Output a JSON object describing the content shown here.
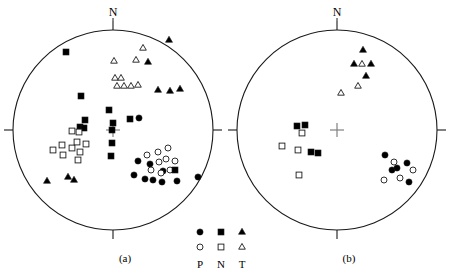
{
  "figure": {
    "type": "stereonet-pair",
    "panels": [
      {
        "id": "a",
        "label": "(a)",
        "north_label": "N"
      },
      {
        "id": "b",
        "label": "(b)",
        "north_label": "N"
      }
    ]
  },
  "legend": {
    "columns": [
      {
        "key": "P",
        "label": "P",
        "filled_symbol": "filled-circle",
        "open_symbol": "open-circle"
      },
      {
        "key": "N",
        "label": "N",
        "filled_symbol": "filled-square",
        "open_symbol": "open-square"
      },
      {
        "key": "T",
        "label": "T",
        "filled_symbol": "filled-triangle",
        "open_symbol": "open-triangle"
      }
    ]
  },
  "colors": {
    "stroke": "#1a1a1a",
    "fill": "#000000",
    "open_fill": "#ffffff",
    "center_cross": "#808080",
    "background": "#ffffff"
  },
  "chart_data": {
    "type": "scatter",
    "title": "",
    "subtitle": "",
    "xlabel": "",
    "ylabel": "",
    "grid": false,
    "legend_position": "bottom-center",
    "projection": "lower-hemisphere stereographic (equal-area) net",
    "axis_note": "Coordinates are plot pixels; circle centre is the net origin, radius = 100",
    "panels": [
      {
        "id": "a",
        "label": "(a)",
        "center": [
          113,
          130
        ],
        "radius": 100,
        "ticks": [
          "N",
          "E",
          "S",
          "W"
        ],
        "series": [
          {
            "name": "P filled",
            "symbol": "filled-circle",
            "points": [
              [
                138,
                161
              ],
              [
                134,
                175
              ],
              [
                145,
                179
              ],
              [
                153,
                180
              ],
              [
                150,
                164
              ],
              [
                163,
                171
              ],
              [
                162,
                182
              ],
              [
                177,
                181
              ],
              [
                198,
                177
              ],
              [
                139,
                118
              ]
            ]
          },
          {
            "name": "P open",
            "symbol": "open-circle",
            "points": [
              [
                147,
                155
              ],
              [
                158,
                152
              ],
              [
                168,
                148
              ],
              [
                159,
                162
              ],
              [
                151,
                170
              ],
              [
                161,
                173
              ],
              [
                170,
                170
              ],
              [
                166,
                159
              ],
              [
                175,
                161
              ]
            ]
          },
          {
            "name": "N filled",
            "symbol": "filled-square",
            "points": [
              [
                66,
                52
              ],
              [
                81,
                96
              ],
              [
                112,
                130
              ],
              [
                109,
                110
              ],
              [
                113,
                123
              ],
              [
                130,
                119
              ],
              [
                85,
                120
              ],
              [
                80,
                127
              ],
              [
                84,
                128
              ],
              [
                111,
                156
              ],
              [
                112,
                143
              ],
              [
                175,
                170
              ]
            ]
          },
          {
            "name": "N open",
            "symbol": "open-square",
            "points": [
              [
                72,
                131
              ],
              [
                79,
                132
              ],
              [
                53,
                150
              ],
              [
                63,
                155
              ],
              [
                62,
                145
              ],
              [
                72,
                148
              ],
              [
                77,
                142
              ],
              [
                80,
                152
              ],
              [
                86,
                144
              ],
              [
                78,
                160
              ]
            ]
          },
          {
            "name": "T filled",
            "symbol": "filled-triangle",
            "points": [
              [
                169,
                40
              ],
              [
                148,
                62
              ],
              [
                180,
                89
              ],
              [
                158,
                90
              ],
              [
                170,
                91
              ],
              [
                47,
                181
              ],
              [
                68,
                177
              ],
              [
                74,
                180
              ]
            ]
          },
          {
            "name": "T open",
            "symbol": "open-triangle",
            "points": [
              [
                143,
                48
              ],
              [
                114,
                61
              ],
              [
                136,
                60
              ],
              [
                115,
                78
              ],
              [
                121,
                78
              ],
              [
                117,
                86
              ],
              [
                124,
                86
              ],
              [
                131,
                86
              ],
              [
                138,
                85
              ]
            ]
          }
        ]
      },
      {
        "id": "b",
        "label": "(b)",
        "center": [
          337,
          130
        ],
        "radius": 100,
        "ticks": [
          "N",
          "E",
          "S",
          "W"
        ],
        "series": [
          {
            "name": "P filled",
            "symbol": "filled-circle",
            "points": [
              [
                385,
                155
              ],
              [
                392,
                170
              ],
              [
                397,
                168
              ],
              [
                407,
                163
              ],
              [
                409,
                182
              ]
            ]
          },
          {
            "name": "P open",
            "symbol": "open-circle",
            "points": [
              [
                394,
                162
              ],
              [
                400,
                178
              ],
              [
                384,
                180
              ],
              [
                413,
                170
              ]
            ]
          },
          {
            "name": "N filled",
            "symbol": "filled-square",
            "points": [
              [
                297,
                126
              ],
              [
                305,
                125
              ],
              [
                311,
                152
              ],
              [
                318,
                153
              ]
            ]
          },
          {
            "name": "N open",
            "symbol": "open-square",
            "points": [
              [
                302,
                133
              ],
              [
                282,
                146
              ],
              [
                298,
                150
              ],
              [
                299,
                175
              ]
            ]
          },
          {
            "name": "T filled",
            "symbol": "filled-triangle",
            "points": [
              [
                363,
                50
              ],
              [
                354,
                64
              ],
              [
                371,
                64
              ],
              [
                366,
                76
              ]
            ]
          },
          {
            "name": "T open",
            "symbol": "open-triangle",
            "points": [
              [
                362,
                64
              ],
              [
                358,
                86
              ],
              [
                341,
                93
              ]
            ]
          }
        ]
      }
    ]
  }
}
